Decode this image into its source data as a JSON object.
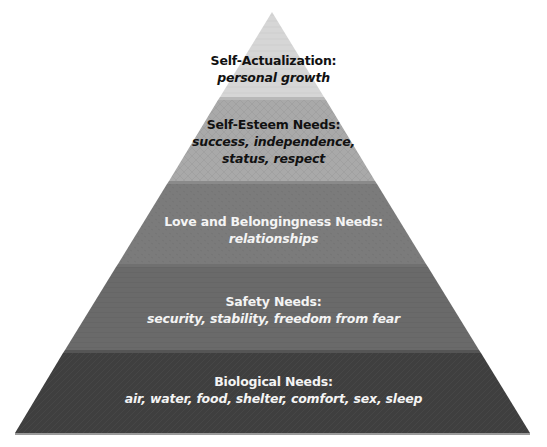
{
  "diagram": {
    "type": "pyramid",
    "apex": [
      272,
      12
    ],
    "base": {
      "left": 15,
      "right": 530,
      "y": 433
    },
    "tiers": [
      {
        "level": 5,
        "title": "Self-Actualization:",
        "description_lines": [
          "personal growth"
        ],
        "fill": "#d6d6d6",
        "text_color": "#111111"
      },
      {
        "level": 4,
        "title": "Self-Esteem Needs:",
        "description_lines": [
          "success, independence,",
          "status, respect"
        ],
        "fill": "#a9a9a9",
        "text_color": "#111111"
      },
      {
        "level": 3,
        "title": "Love and Belongingness Needs:",
        "description_lines": [
          "relationships"
        ],
        "fill": "#7b7b7b",
        "text_color": "#f4f4f4"
      },
      {
        "level": 2,
        "title": "Safety Needs:",
        "description_lines": [
          "security, stability, freedom from fear"
        ],
        "fill": "#6a6a6a",
        "text_color": "#f4f4f4"
      },
      {
        "level": 1,
        "title": "Biological Needs:",
        "description_lines": [
          "air, water, food, shelter, comfort, sex, sleep"
        ],
        "fill": "#3f3f3f",
        "text_color": "#f4f4f4"
      }
    ]
  }
}
